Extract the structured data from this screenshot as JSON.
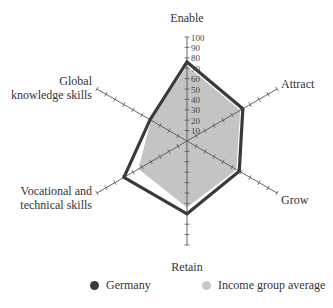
{
  "chart_data": {
    "type": "radar",
    "title": "",
    "axes": [
      "Enable",
      "Attract",
      "Grow",
      "Retain",
      "Vocational and technical skills",
      "Global knowledge skills"
    ],
    "axis_labels_display": [
      [
        "Enable"
      ],
      [
        "Attract"
      ],
      [
        "Grow"
      ],
      [
        "Retain"
      ],
      [
        "Vocational and",
        "technical skills"
      ],
      [
        "Global",
        "knowledge skills"
      ]
    ],
    "radial_ticks": [
      10,
      20,
      30,
      40,
      50,
      60,
      70,
      80,
      90,
      100
    ],
    "range": [
      0,
      100
    ],
    "series": [
      {
        "name": "Germany",
        "values": [
          76,
          62,
          58,
          70,
          70,
          41
        ],
        "color": "#3a3a3a",
        "style": "outline"
      },
      {
        "name": "Income group average",
        "values": [
          72,
          59,
          55,
          64,
          54,
          40
        ],
        "color": "#c4c4c4",
        "style": "filled"
      }
    ],
    "legend_position": "bottom"
  },
  "legend": {
    "items": [
      {
        "label": "Germany",
        "color": "#3a3a3a"
      },
      {
        "label": "Income group average",
        "color": "#c8c8c8"
      }
    ]
  }
}
